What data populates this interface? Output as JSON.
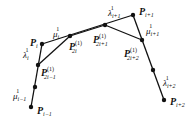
{
  "diagram": {
    "type": "subdivision-control-polygon",
    "colors": {
      "line": "#111111",
      "point": "#111111",
      "text": "#111111",
      "background": "#ffffff"
    },
    "points": [
      {
        "id": "P_i-1",
        "x": 31,
        "y": 107
      },
      {
        "id": "mid_low_left",
        "x": 35,
        "y": 87
      },
      {
        "id": "P_2i-1",
        "x": 38,
        "y": 65
      },
      {
        "id": "P_i",
        "x": 42,
        "y": 44
      },
      {
        "id": "P_2i",
        "x": 70,
        "y": 36
      },
      {
        "id": "P_2i+1",
        "x": 105,
        "y": 25
      },
      {
        "id": "P_i+1",
        "x": 133,
        "y": 15
      },
      {
        "id": "P_2i+2",
        "x": 142,
        "y": 40
      },
      {
        "id": "mid_low_right",
        "x": 153,
        "y": 70
      },
      {
        "id": "P_i+2",
        "x": 164,
        "y": 100
      }
    ],
    "labels": {
      "P_i": {
        "main": "P",
        "sub": "i",
        "sup": ""
      },
      "P_i-1": {
        "main": "P",
        "sub": "i−1",
        "sup": ""
      },
      "P_i+1": {
        "main": "P",
        "sub": "i+1",
        "sup": ""
      },
      "P_i+2": {
        "main": "P",
        "sub": "i+2",
        "sup": ""
      },
      "P_2i": {
        "main": "P",
        "sub": "2i",
        "sup": "(1)"
      },
      "P_2i-1": {
        "main": "P",
        "sub": "2i−1",
        "sup": "(1)"
      },
      "P_2i+1": {
        "main": "P",
        "sub": "2i+1",
        "sup": "(1)"
      },
      "P_2i+2": {
        "main": "P",
        "sub": "2i+2",
        "sup": "(1)"
      },
      "mu_i": {
        "main": "μ",
        "sub": "i",
        "sup": "1"
      },
      "lambda_i": {
        "main": "λ",
        "sub": "i",
        "sup": "1"
      },
      "mu_i-1": {
        "main": "μ",
        "sub": "i−1",
        "sup": "1"
      },
      "lambda_i+1": {
        "main": "λ",
        "sub": "i+1",
        "sup": "1"
      },
      "mu_i+1": {
        "main": "μ",
        "sub": "i+1",
        "sup": "1"
      },
      "lambda_i+2": {
        "main": "λ",
        "sub": "i+2",
        "sup": "1"
      }
    }
  }
}
